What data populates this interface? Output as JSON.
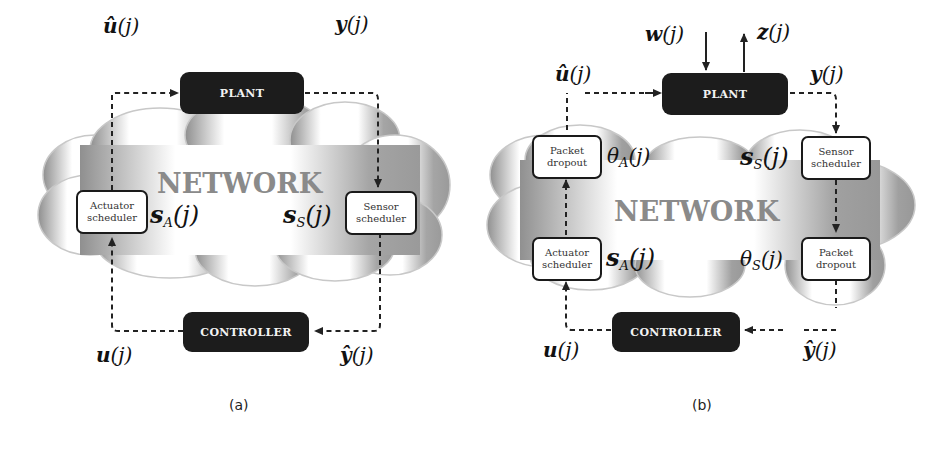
{
  "figure": {
    "panels": [
      {
        "id": "a",
        "caption": "(a)",
        "network_label": "NETWORK",
        "blocks": {
          "plant": "PLANT",
          "controller": "CONTROLLER",
          "actuator_scheduler": [
            "Actuator",
            "scheduler"
          ],
          "sensor_scheduler": [
            "Sensor",
            "scheduler"
          ]
        },
        "signals": {
          "u_hat": {
            "sym": "û",
            "arg": "(j)"
          },
          "y": {
            "sym": "y",
            "arg": "(j)"
          },
          "u": {
            "sym": "u",
            "arg": "(j)"
          },
          "y_hat": {
            "sym": "ŷ",
            "arg": "(j)"
          },
          "s_a": {
            "sym": "s",
            "sub": "A",
            "arg": "(j)"
          },
          "s_s": {
            "sym": "s",
            "sub": "S",
            "arg": "(j)"
          }
        }
      },
      {
        "id": "b",
        "caption": "(b)",
        "network_label": "NETWORK",
        "blocks": {
          "plant": "PLANT",
          "controller": "CONTROLLER",
          "actuator_scheduler": [
            "Actuator",
            "scheduler"
          ],
          "sensor_scheduler": [
            "Sensor",
            "scheduler"
          ],
          "actuator_dropout": [
            "Packet",
            "dropout"
          ],
          "sensor_dropout": [
            "Packet",
            "dropout"
          ]
        },
        "signals": {
          "w": {
            "sym": "w",
            "arg": "(j)"
          },
          "z": {
            "sym": "z",
            "arg": "(j)"
          },
          "u_hat": {
            "sym": "û",
            "arg": "(j)"
          },
          "y": {
            "sym": "y",
            "arg": "(j)"
          },
          "u": {
            "sym": "u",
            "arg": "(j)"
          },
          "y_hat": {
            "sym": "ŷ",
            "arg": "(j)"
          },
          "s_a": {
            "sym": "s",
            "sub": "A",
            "arg": "(j)"
          },
          "s_s": {
            "sym": "s",
            "sub": "S",
            "arg": "(j)"
          },
          "theta_a": {
            "sym": "θ",
            "sub": "A",
            "arg": "(j)"
          },
          "theta_s": {
            "sym": "θ",
            "sub": "S",
            "arg": "(j)"
          }
        }
      }
    ],
    "colors": {
      "dark_block": "#1c1c1c",
      "cloud_gray": "#9a9a9a",
      "network_text": "#8a8a8a",
      "line": "#222222"
    }
  }
}
